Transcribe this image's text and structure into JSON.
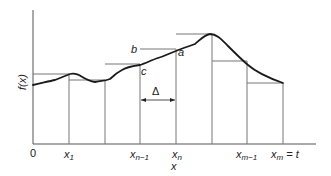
{
  "diagram": {
    "type": "riemann-sum-approximation",
    "y_axis_label": "f(x)",
    "x_axis_label": "x",
    "origin_label": "0",
    "x_ticks": [
      {
        "base": "x",
        "sub": "1",
        "suffix": ""
      },
      {
        "base": "x",
        "sub": "n−1",
        "suffix": ""
      },
      {
        "base": "x",
        "sub": "n",
        "suffix": ""
      },
      {
        "base": "x",
        "sub": "m−1",
        "suffix": ""
      },
      {
        "base": "x",
        "sub": "m",
        "suffix": " = t"
      }
    ],
    "point_labels": {
      "a": "a",
      "b": "b",
      "c": "c"
    },
    "interval_label": "Δ",
    "colors": {
      "curve": "#1a1a1a",
      "rectangles": "#777777",
      "axes": "#555555"
    }
  }
}
